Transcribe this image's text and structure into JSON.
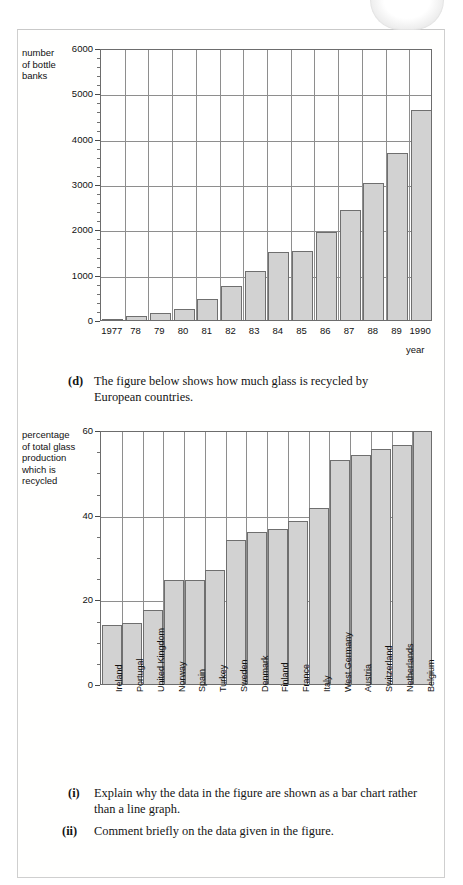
{
  "page": {
    "tab_label": ""
  },
  "figure1": {
    "name": "bottle-banks-bar-chart",
    "y_axis_title": "number\nof bottle\nbanks",
    "x_axis_name": "year",
    "chart_data": {
      "type": "bar",
      "title": "",
      "subtitle": "",
      "xlabel": "year",
      "ylabel": "number of bottle banks",
      "categories": [
        "1977",
        "78",
        "79",
        "80",
        "81",
        "82",
        "83",
        "84",
        "85",
        "86",
        "87",
        "88",
        "89",
        "1990"
      ],
      "values": [
        20,
        90,
        150,
        250,
        470,
        740,
        1080,
        1500,
        1530,
        1950,
        2430,
        3030,
        3680,
        4640,
        5830
      ],
      "ylim": [
        0,
        6000
      ],
      "ytick_major": [
        0,
        1000,
        2000,
        3000,
        4000,
        5000,
        6000
      ],
      "ytick_minor_step": 200,
      "grid": "both",
      "legend": "none",
      "bar_color": "#d2d2d2",
      "bar_edge_color": "#6f6f6f"
    },
    "bars": [
      {
        "label": "1977",
        "value": 20
      },
      {
        "label": "78",
        "value": 90
      },
      {
        "label": "79",
        "value": 150
      },
      {
        "label": "80",
        "value": 470
      },
      {
        "label": "81",
        "value": 740
      },
      {
        "label": "82",
        "value": 1080
      },
      {
        "label": "83",
        "value": 1530
      },
      {
        "label": "84",
        "value": 1950
      },
      {
        "label": "85",
        "value": 2430
      },
      {
        "label": "86",
        "value": 3030
      },
      {
        "label": "87",
        "value": 3680
      },
      {
        "label": "88",
        "value": 4640
      },
      {
        "label": "89",
        "value": 5830
      },
      {
        "label": "1990",
        "value": 5830
      }
    ]
  },
  "paragraph_d": {
    "marker": "(d)",
    "text": "The figure below shows how much glass is recycled by European countries."
  },
  "figure2": {
    "name": "glass-recycling-bar-chart",
    "y_axis_title": "percentage\nof total glass\nproduction\nwhich is\nrecycled",
    "chart_data": {
      "type": "bar",
      "title": "",
      "subtitle": "",
      "xlabel": "",
      "ylabel": "percentage of total glass production which is recycled",
      "categories": [
        "Ireland",
        "Portugal",
        "United Kingdom",
        "Norway",
        "Spain",
        "Turkey",
        "Sweden",
        "Denmark",
        "Finland",
        "France",
        "Italy",
        "West Germany",
        "Austria",
        "Switzerland",
        "Netherlands",
        "Belgium"
      ],
      "values": [
        14,
        14.5,
        17.5,
        24.5,
        24.5,
        27,
        34,
        36,
        36.5,
        38.5,
        41.5,
        53,
        54,
        55.5,
        56.5,
        60
      ],
      "ylim": [
        0,
        60
      ],
      "ytick_major": [
        0,
        20,
        40,
        60
      ],
      "ytick_minor_step": 5,
      "grid": "both",
      "legend": "none",
      "bar_color": "#d2d2d2",
      "bar_edge_color": "#6f6f6f"
    }
  },
  "question_i": {
    "marker": "(i)",
    "text": "Explain why the data in the figure are shown as a bar chart rather than a line graph."
  },
  "question_ii": {
    "marker": "(ii)",
    "text": "Comment briefly on the data given in the figure."
  },
  "colors": {
    "bar_fill": "#d2d2d2",
    "bar_edge": "#6f6f6f",
    "grid": "#8e8e8e",
    "text": "#141414",
    "page_border": "#cfcfcf"
  }
}
